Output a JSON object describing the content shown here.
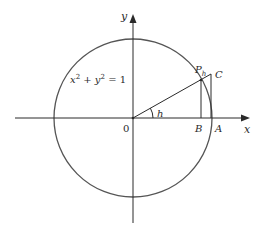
{
  "diagram": {
    "equation": "x² + y² = 1",
    "equation_parts": {
      "x": "x",
      "exp1": "2",
      "plus": " + ",
      "y": "y",
      "exp2": "2",
      "eq": " = 1"
    },
    "labels": {
      "x_axis": "x",
      "y_axis": "y",
      "origin": "0",
      "angle": "h",
      "point_P": "P",
      "point_P_sub": "h",
      "point_C": "C",
      "point_B": "B",
      "point_A": "A"
    },
    "colors": {
      "stroke": "#2a2a2a",
      "circle": "#555555",
      "background": "#ffffff"
    }
  }
}
